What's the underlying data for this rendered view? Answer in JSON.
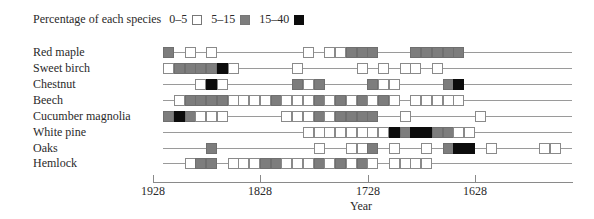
{
  "legend": {
    "title": "Percentage of each species",
    "items": [
      {
        "label": "0–5",
        "color": "#ffffff"
      },
      {
        "label": "5–15",
        "color": "#7d7d7d"
      },
      {
        "label": "15–40",
        "color": "#0c0c0c"
      }
    ]
  },
  "axis": {
    "xlabel": "Year",
    "ticks": [
      {
        "label": "1928",
        "x": 153
      },
      {
        "label": "1828",
        "x": 260
      },
      {
        "label": "1728",
        "x": 368
      },
      {
        "label": "1628",
        "x": 475
      }
    ]
  },
  "chart_data": {
    "type": "heatmap",
    "title": "",
    "xlabel": "Year",
    "ylabel": "",
    "x_axis": {
      "direction": "decreasing",
      "ticks": [
        "1928",
        "1828",
        "1728",
        "1628"
      ],
      "cell_years": 10,
      "first_cell_year_approx": 1918
    },
    "legend": [
      {
        "code": "w",
        "label": "0–5"
      },
      {
        "code": "g",
        "label": "5–15"
      },
      {
        "code": "b",
        "label": "15–40"
      }
    ],
    "note": "cells: [index, class] where index 0 ≈ 1918-1928 decade and each index step is 10 years earlier",
    "series": [
      {
        "name": "Red maple",
        "cells": [
          [
            0,
            "g"
          ],
          [
            2,
            "w"
          ],
          [
            4,
            "w"
          ],
          [
            13,
            "w"
          ],
          [
            15,
            "w"
          ],
          [
            16,
            "w"
          ],
          [
            17,
            "g"
          ],
          [
            18,
            "g"
          ],
          [
            19,
            "g"
          ],
          [
            23,
            "g"
          ],
          [
            24,
            "g"
          ],
          [
            25,
            "g"
          ],
          [
            26,
            "g"
          ],
          [
            27,
            "g"
          ]
        ]
      },
      {
        "name": "Sweet birch",
        "cells": [
          [
            0,
            "w"
          ],
          [
            1,
            "g"
          ],
          [
            2,
            "g"
          ],
          [
            3,
            "g"
          ],
          [
            4,
            "g"
          ],
          [
            5,
            "b"
          ],
          [
            6,
            "w"
          ],
          [
            12,
            "w"
          ],
          [
            18,
            "w"
          ],
          [
            20,
            "w"
          ],
          [
            22,
            "w"
          ],
          [
            23,
            "w"
          ],
          [
            25,
            "w"
          ]
        ]
      },
      {
        "name": "Chestnut",
        "cells": [
          [
            3,
            "w"
          ],
          [
            4,
            "b"
          ],
          [
            5,
            "w"
          ],
          [
            12,
            "g"
          ],
          [
            13,
            "w"
          ],
          [
            14,
            "g"
          ],
          [
            19,
            "g"
          ],
          [
            20,
            "w"
          ],
          [
            21,
            "w"
          ],
          [
            26,
            "g"
          ],
          [
            27,
            "b"
          ]
        ]
      },
      {
        "name": "Beech",
        "cells": [
          [
            1,
            "w"
          ],
          [
            2,
            "g"
          ],
          [
            3,
            "g"
          ],
          [
            4,
            "g"
          ],
          [
            5,
            "g"
          ],
          [
            6,
            "w"
          ],
          [
            7,
            "w"
          ],
          [
            8,
            "w"
          ],
          [
            9,
            "w"
          ],
          [
            10,
            "g"
          ],
          [
            11,
            "w"
          ],
          [
            12,
            "w"
          ],
          [
            13,
            "w"
          ],
          [
            14,
            "g"
          ],
          [
            15,
            "w"
          ],
          [
            16,
            "g"
          ],
          [
            17,
            "w"
          ],
          [
            18,
            "g"
          ],
          [
            19,
            "w"
          ],
          [
            20,
            "g"
          ],
          [
            21,
            "w"
          ],
          [
            23,
            "w"
          ],
          [
            24,
            "w"
          ],
          [
            25,
            "w"
          ],
          [
            26,
            "w"
          ],
          [
            27,
            "w"
          ]
        ]
      },
      {
        "name": "Cucumber magnolia",
        "cells": [
          [
            0,
            "g"
          ],
          [
            1,
            "b"
          ],
          [
            2,
            "g"
          ],
          [
            3,
            "w"
          ],
          [
            4,
            "w"
          ],
          [
            5,
            "w"
          ],
          [
            11,
            "w"
          ],
          [
            12,
            "w"
          ],
          [
            13,
            "w"
          ],
          [
            14,
            "g"
          ],
          [
            15,
            "w"
          ],
          [
            16,
            "g"
          ],
          [
            17,
            "g"
          ],
          [
            18,
            "g"
          ],
          [
            19,
            "g"
          ],
          [
            22,
            "w"
          ],
          [
            29,
            "w"
          ]
        ]
      },
      {
        "name": "White pine",
        "cells": [
          [
            13,
            "w"
          ],
          [
            14,
            "w"
          ],
          [
            15,
            "w"
          ],
          [
            16,
            "w"
          ],
          [
            17,
            "w"
          ],
          [
            18,
            "w"
          ],
          [
            19,
            "w"
          ],
          [
            20,
            "w"
          ],
          [
            21,
            "b"
          ],
          [
            22,
            "g"
          ],
          [
            23,
            "b"
          ],
          [
            24,
            "b"
          ],
          [
            25,
            "g"
          ],
          [
            26,
            "g"
          ],
          [
            27,
            "w"
          ],
          [
            28,
            "w"
          ]
        ]
      },
      {
        "name": "Oaks",
        "cells": [
          [
            4,
            "g"
          ],
          [
            14,
            "w"
          ],
          [
            17,
            "w"
          ],
          [
            18,
            "w"
          ],
          [
            19,
            "g"
          ],
          [
            21,
            "w"
          ],
          [
            24,
            "w"
          ],
          [
            26,
            "g"
          ],
          [
            27,
            "b"
          ],
          [
            28,
            "b"
          ],
          [
            30,
            "w"
          ],
          [
            35,
            "w"
          ],
          [
            36,
            "w"
          ]
        ]
      },
      {
        "name": "Hemlock",
        "cells": [
          [
            2,
            "w"
          ],
          [
            3,
            "g"
          ],
          [
            4,
            "g"
          ],
          [
            6,
            "w"
          ],
          [
            7,
            "w"
          ],
          [
            8,
            "w"
          ],
          [
            9,
            "g"
          ],
          [
            10,
            "g"
          ],
          [
            11,
            "w"
          ],
          [
            12,
            "w"
          ],
          [
            13,
            "w"
          ],
          [
            14,
            "g"
          ],
          [
            15,
            "w"
          ],
          [
            16,
            "g"
          ],
          [
            17,
            "w"
          ],
          [
            18,
            "g"
          ],
          [
            19,
            "w"
          ],
          [
            21,
            "w"
          ],
          [
            22,
            "w"
          ],
          [
            23,
            "w"
          ],
          [
            24,
            "w"
          ]
        ]
      }
    ]
  }
}
